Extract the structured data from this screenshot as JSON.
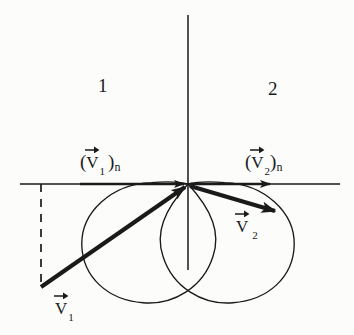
{
  "figure": {
    "background_color": "#fcfcfa",
    "ink_color": "#1a1a1a",
    "regions": [
      {
        "id": "region-1",
        "label": "1",
        "x": 98,
        "y": 76
      },
      {
        "id": "region-2",
        "label": "2",
        "x": 268,
        "y": 79
      }
    ],
    "labels": {
      "v1_normal": {
        "open_paren": "(",
        "symbol": "V",
        "subscript": "1",
        "close_paren": ")",
        "outer_subscript": "n",
        "x": 80,
        "y": 152
      },
      "v2_normal": {
        "open_paren": "(",
        "symbol": "V",
        "subscript": "2",
        "close_paren": ")",
        "outer_subscript": "n",
        "x": 245,
        "y": 152
      },
      "v2_resultant": {
        "symbol": "V",
        "subscript": "2",
        "x": 236,
        "y": 218
      },
      "v1_resultant": {
        "symbol": "V",
        "subscript": "1",
        "x": 55,
        "y": 300
      }
    },
    "axes": {
      "origin": {
        "x": 188,
        "y": 184
      },
      "horizontal": {
        "x1": 20,
        "y1": 184,
        "x2": 340,
        "y2": 184
      },
      "vertical": {
        "x1": 188,
        "y1": 15,
        "x2": 188,
        "y2": 270
      }
    },
    "lobes": [
      {
        "name": "left-lobe",
        "side": "left"
      },
      {
        "name": "right-lobe",
        "side": "right"
      }
    ],
    "vectors": [
      {
        "name": "v1-normal-arrow",
        "from": {
          "x": 80,
          "y": 184
        },
        "to": {
          "x": 186,
          "y": 184
        },
        "style": "solid-thick"
      },
      {
        "name": "v2-normal-arrow",
        "from": {
          "x": 190,
          "y": 184
        },
        "to": {
          "x": 272,
          "y": 184
        },
        "style": "solid-thick"
      },
      {
        "name": "v1-resultant-arrow",
        "from": {
          "x": 41,
          "y": 287
        },
        "to": {
          "x": 186,
          "y": 186
        },
        "style": "solid-heavy"
      },
      {
        "name": "v2-resultant-arrow",
        "from": {
          "x": 190,
          "y": 186
        },
        "to": {
          "x": 277,
          "y": 212
        },
        "style": "solid-heavy"
      }
    ],
    "dashed_line": {
      "name": "v1-vertical-component-guide",
      "from": {
        "x": 41,
        "y": 184
      },
      "to": {
        "x": 41,
        "y": 287
      },
      "style": "dashed"
    }
  }
}
